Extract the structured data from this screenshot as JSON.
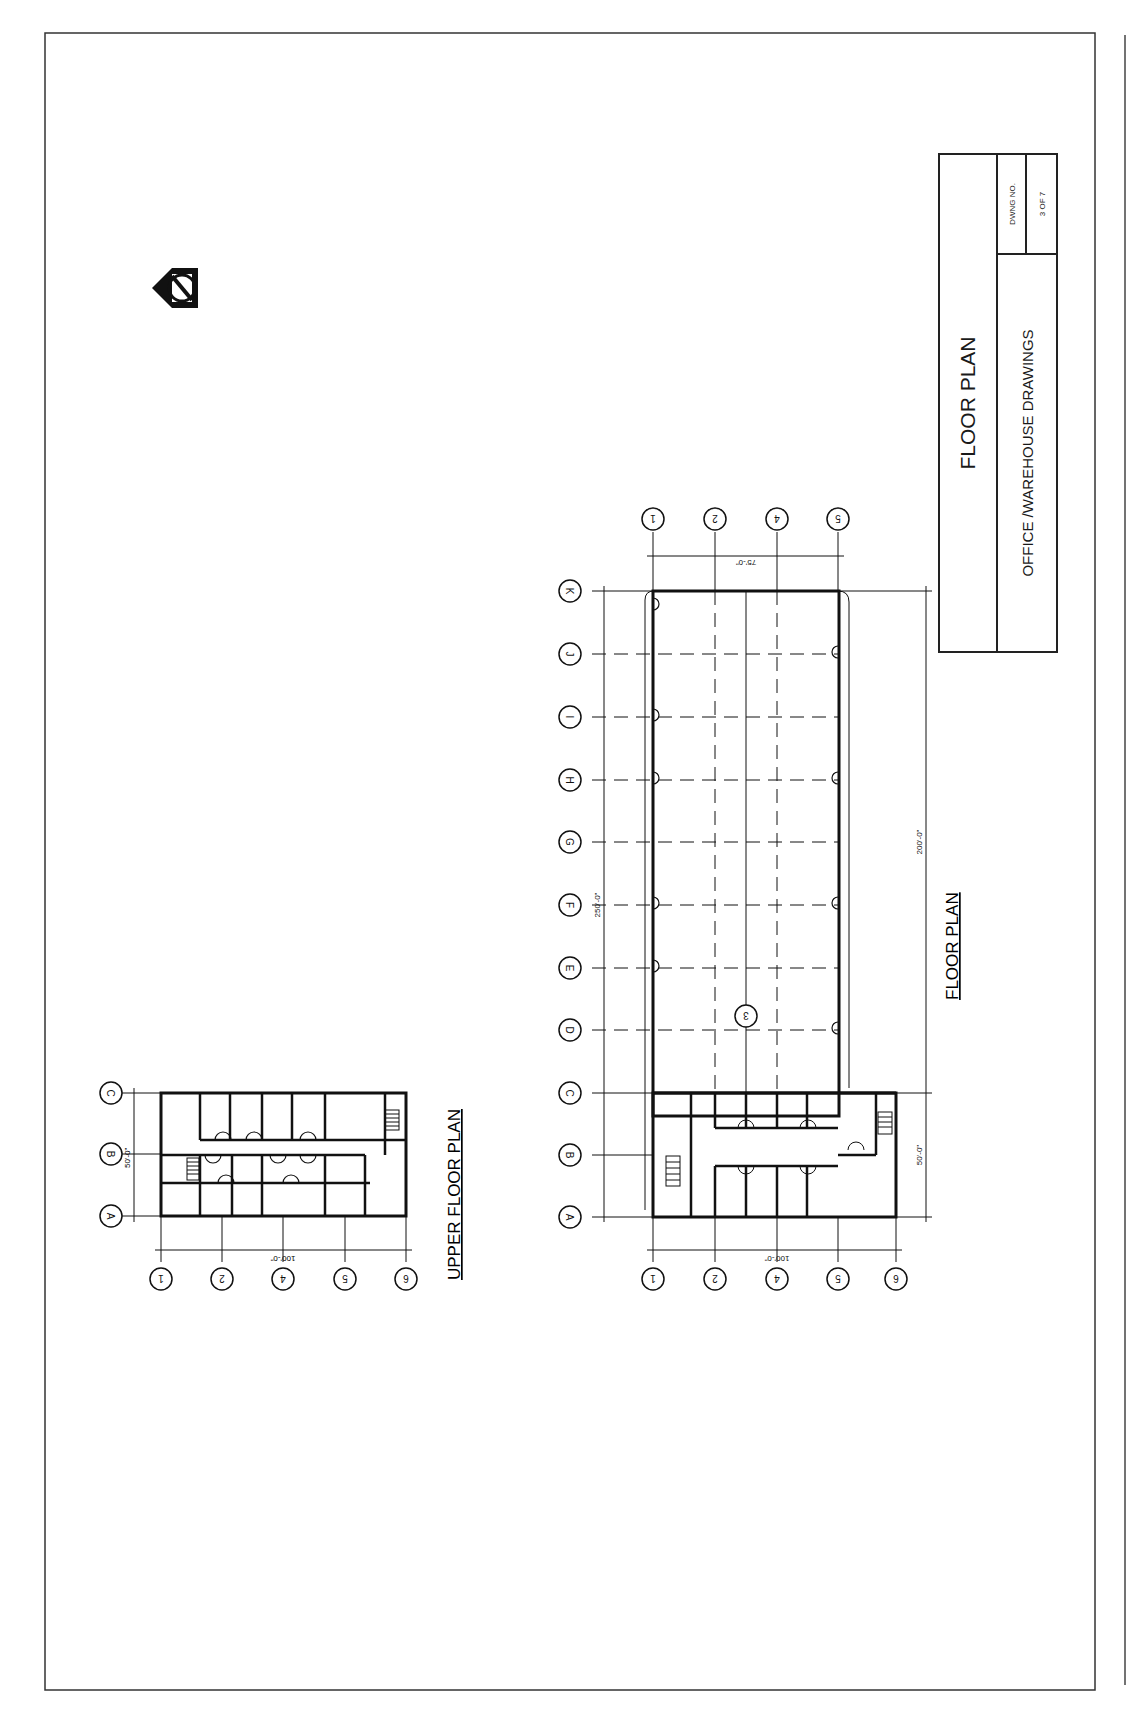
{
  "sheet": {
    "border_color": "#222222",
    "title_block": {
      "title": "FLOOR PLAN",
      "subtitle": "OFFICE /WAREHOUSE DRAWINGS",
      "drawing_no_label": "DWNG NO.",
      "drawing_no_value": "3 OF 7"
    },
    "north_arrow": {
      "icon": "north-arrow-icon",
      "letter": "N"
    }
  },
  "upper_floor_plan": {
    "caption": "UPPER FLOOR PLAN",
    "row_grid_labels": [
      "A",
      "B",
      "C"
    ],
    "column_grid_labels": [
      "1",
      "2",
      "4",
      "5",
      "6"
    ],
    "dimensions": {
      "width": "50'-0\"",
      "length": "100'-0\""
    }
  },
  "floor_plan": {
    "caption": "FLOOR PLAN",
    "row_grid_labels": [
      "A",
      "B",
      "C",
      "D",
      "E",
      "F",
      "G",
      "H",
      "I",
      "J",
      "K"
    ],
    "column_grid_labels_bottom": [
      "1",
      "2",
      "4",
      "5",
      "6"
    ],
    "column_grid_labels_top": [
      "1",
      "2",
      "4",
      "5"
    ],
    "interior_grid_label": "3",
    "dimensions": {
      "overall_length": "250'-0\"",
      "warehouse_length": "200'-0\"",
      "office_length": "50'-0\"",
      "office_width": "100'-0\"",
      "warehouse_width": "75'-0\""
    }
  }
}
